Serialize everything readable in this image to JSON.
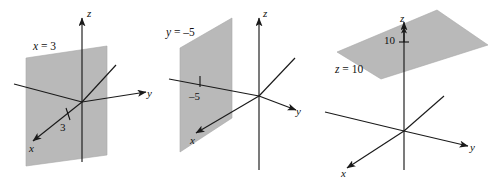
{
  "figure": {
    "background_color": "#ffffff",
    "plane_fill_color": "#b9b9b9",
    "axis_color": "#1a1a1a",
    "panels": [
      {
        "id": "panel-x-equals-3",
        "equation_label": "x = 3",
        "equation_var": "x",
        "equation_rest": " = 3",
        "axis_labels": {
          "x": "x",
          "y": "y",
          "z": "z"
        },
        "measure_label": "3",
        "description": "Vertical plane x = 3 perpendicular to the x-axis"
      },
      {
        "id": "panel-y-equals-minus-5",
        "equation_label": "y = –5",
        "equation_var": "y",
        "equation_rest": " = –5",
        "axis_labels": {
          "x": "x",
          "y": "y",
          "z": "z"
        },
        "measure_label": "–5",
        "description": "Vertical plane y = -5 perpendicular to the y-axis"
      },
      {
        "id": "panel-z-equals-10",
        "equation_label": "z = 10",
        "equation_var": "z",
        "equation_rest": " = 10",
        "axis_labels": {
          "x": "x",
          "y": "y",
          "z": "z"
        },
        "measure_label": "10",
        "description": "Horizontal plane z = 10 perpendicular to the z-axis"
      }
    ]
  }
}
